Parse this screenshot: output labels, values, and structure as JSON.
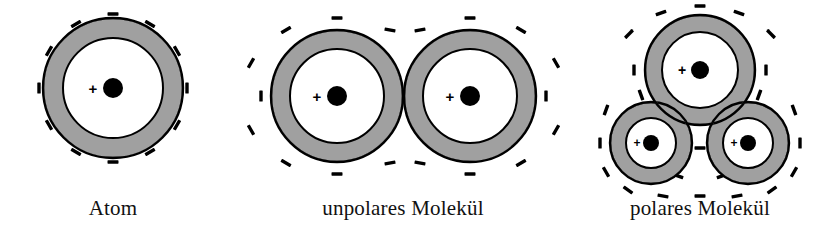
{
  "figure": {
    "background_color": "#ffffff",
    "shell_color": "#a0a0a0",
    "outline_color": "#000000",
    "interior_color": "#ffffff",
    "nucleus_color": "#000000",
    "language": "de"
  },
  "panels": [
    {
      "id": "atom",
      "caption": "Atom",
      "caption_x": 113,
      "caption_y": 215,
      "description": "single atom with spherical electron shell",
      "atoms": [
        {
          "cx": 113,
          "cy": 88,
          "shell_r": 70,
          "core_r": 50,
          "nucleus_r": 10,
          "plus_label": "+",
          "plus_dx": -20,
          "plus_dy": 0,
          "plus_size": 15
        }
      ],
      "minus_label": "–",
      "minus_marks": [
        {
          "x": 113,
          "y": 14,
          "angle": 0
        },
        {
          "x": 150,
          "y": 24,
          "angle": 30
        },
        {
          "x": 177,
          "y": 51,
          "angle": 60
        },
        {
          "x": 187,
          "y": 88,
          "angle": 90
        },
        {
          "x": 177,
          "y": 125,
          "angle": 120
        },
        {
          "x": 150,
          "y": 152,
          "angle": 150
        },
        {
          "x": 113,
          "y": 162,
          "angle": 180
        },
        {
          "x": 76,
          "y": 152,
          "angle": 210
        },
        {
          "x": 49,
          "y": 125,
          "angle": 240
        },
        {
          "x": 39,
          "y": 88,
          "angle": 270
        },
        {
          "x": 49,
          "y": 51,
          "angle": 300
        },
        {
          "x": 76,
          "y": 24,
          "angle": 330
        }
      ]
    },
    {
      "id": "nonpolar-molecule",
      "caption": "unpolares Molekül",
      "caption_x": 403,
      "caption_y": 215,
      "description": "two identical atoms merged into a symmetric diatomic molecule",
      "atoms": [
        {
          "cx": 337,
          "cy": 96,
          "shell_r": 66,
          "core_r": 47,
          "nucleus_r": 10,
          "plus_label": "+",
          "plus_dx": -20,
          "plus_dy": 0,
          "plus_size": 15
        },
        {
          "cx": 470,
          "cy": 96,
          "shell_r": 66,
          "core_r": 47,
          "nucleus_r": 10,
          "plus_label": "+",
          "plus_dx": -20,
          "plus_dy": 0,
          "plus_size": 15
        }
      ],
      "minus_label": "–",
      "minus_marks": [
        {
          "x": 337,
          "y": 18,
          "angle": 0
        },
        {
          "x": 286,
          "y": 30,
          "angle": 330
        },
        {
          "x": 251,
          "y": 63,
          "angle": 300
        },
        {
          "x": 261,
          "y": 96,
          "angle": 270
        },
        {
          "x": 251,
          "y": 130,
          "angle": 240
        },
        {
          "x": 286,
          "y": 163,
          "angle": 210
        },
        {
          "x": 337,
          "y": 174,
          "angle": 180
        },
        {
          "x": 390,
          "y": 163,
          "angle": 170
        },
        {
          "x": 390,
          "y": 30,
          "angle": 10
        },
        {
          "x": 470,
          "y": 18,
          "angle": 0
        },
        {
          "x": 521,
          "y": 30,
          "angle": 30
        },
        {
          "x": 556,
          "y": 63,
          "angle": 60
        },
        {
          "x": 546,
          "y": 96,
          "angle": 90
        },
        {
          "x": 556,
          "y": 130,
          "angle": 120
        },
        {
          "x": 521,
          "y": 163,
          "angle": 150
        },
        {
          "x": 470,
          "y": 174,
          "angle": 180
        },
        {
          "x": 420,
          "y": 163,
          "angle": 190
        },
        {
          "x": 420,
          "y": 30,
          "angle": 350
        }
      ]
    },
    {
      "id": "polar-molecule",
      "caption": "polares Molekül",
      "caption_x": 700,
      "caption_y": 215,
      "description": "one large atom with two smaller atoms merged below, water-like geometry",
      "atoms": [
        {
          "cx": 700,
          "cy": 70,
          "shell_r": 55,
          "core_r": 38,
          "nucleus_r": 9,
          "plus_label": "+",
          "plus_dx": -18,
          "plus_dy": 0,
          "plus_size": 14
        },
        {
          "cx": 651,
          "cy": 143,
          "shell_r": 41,
          "core_r": 25,
          "nucleus_r": 8,
          "plus_label": "+",
          "plus_dx": -14,
          "plus_dy": 0,
          "plus_size": 12
        },
        {
          "cx": 748,
          "cy": 143,
          "shell_r": 41,
          "core_r": 25,
          "nucleus_r": 8,
          "plus_label": "+",
          "plus_dx": -14,
          "plus_dy": 0,
          "plus_size": 12
        }
      ],
      "minus_label": "–",
      "minus_marks": [
        {
          "x": 700,
          "y": 6,
          "angle": 0
        },
        {
          "x": 661,
          "y": 13,
          "angle": 340
        },
        {
          "x": 739,
          "y": 13,
          "angle": 20
        },
        {
          "x": 629,
          "y": 34,
          "angle": 315
        },
        {
          "x": 771,
          "y": 34,
          "angle": 45
        },
        {
          "x": 634,
          "y": 70,
          "angle": 270
        },
        {
          "x": 766,
          "y": 70,
          "angle": 90
        },
        {
          "x": 641,
          "y": 95,
          "angle": 250
        },
        {
          "x": 759,
          "y": 95,
          "angle": 110
        },
        {
          "x": 606,
          "y": 110,
          "angle": 290
        },
        {
          "x": 794,
          "y": 110,
          "angle": 70
        },
        {
          "x": 600,
          "y": 143,
          "angle": 270
        },
        {
          "x": 800,
          "y": 143,
          "angle": 90
        },
        {
          "x": 606,
          "y": 172,
          "angle": 240
        },
        {
          "x": 794,
          "y": 172,
          "angle": 120
        },
        {
          "x": 628,
          "y": 190,
          "angle": 215
        },
        {
          "x": 772,
          "y": 190,
          "angle": 145
        },
        {
          "x": 663,
          "y": 196,
          "angle": 190
        },
        {
          "x": 737,
          "y": 196,
          "angle": 170
        },
        {
          "x": 700,
          "y": 196,
          "angle": 180
        },
        {
          "x": 700,
          "y": 148,
          "angle": 180
        },
        {
          "x": 678,
          "y": 176,
          "angle": 200
        },
        {
          "x": 722,
          "y": 176,
          "angle": 160
        }
      ]
    }
  ]
}
